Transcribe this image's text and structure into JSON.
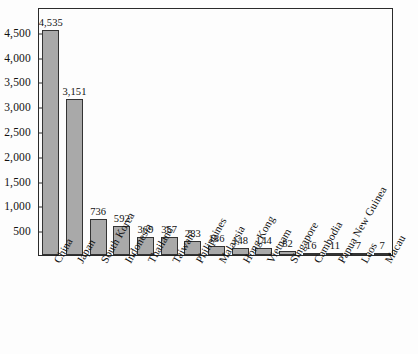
{
  "chart_data": {
    "type": "bar",
    "title": "",
    "xlabel": "",
    "ylabel": "",
    "ylim": [
      0,
      5000
    ],
    "grid": false,
    "legend": false,
    "y_ticks": [
      500,
      1000,
      1500,
      2000,
      2500,
      3000,
      3500,
      4000,
      4500
    ],
    "y_tick_labels": [
      "500",
      "1,000",
      "1,500",
      "2,000",
      "2,500",
      "3,000",
      "3,500",
      "4,000",
      "4,500"
    ],
    "categories": [
      "China",
      "Japan",
      "South Korea",
      "Indonesia",
      "Thailand",
      "Taiwan",
      "Philippines",
      "Malaysia",
      "Hong Kong",
      "Vietnam",
      "Singapore",
      "Cambodia",
      "Papua New Guinea",
      "Laos",
      "Macau"
    ],
    "category_superscripts": [
      "",
      "",
      "",
      "",
      "",
      "a",
      "",
      "",
      "",
      "",
      "",
      "",
      "",
      "",
      ""
    ],
    "values": [
      4535,
      3151,
      736,
      592,
      369,
      357,
      283,
      186,
      148,
      144,
      82,
      16,
      11,
      7,
      7
    ],
    "value_labels": [
      "4,535",
      "3,151",
      "736",
      "592",
      "369",
      "357",
      "283",
      "186",
      "148",
      "144",
      "82",
      "16",
      "11",
      "7",
      "7"
    ]
  },
  "style": {
    "bar_fill": "#a9a9a9",
    "bar_stroke": "#333333",
    "axis_color": "#2b2b2b",
    "text_color": "#111111",
    "background": "#fdfdfd"
  }
}
